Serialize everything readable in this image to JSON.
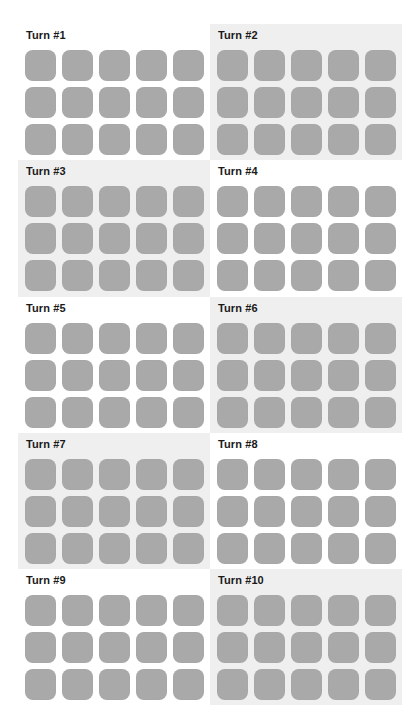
{
  "colors": {
    "tile": "#a9a9a9",
    "panel_shaded": "#efefef",
    "background": "#ffffff",
    "label": "#1a1a1a"
  },
  "grid": {
    "columns": 2,
    "tile_rows": 3,
    "tile_cols": 5
  },
  "turns": [
    {
      "label": "Turn #1",
      "shaded": false
    },
    {
      "label": "Turn #2",
      "shaded": true
    },
    {
      "label": "Turn #3",
      "shaded": true
    },
    {
      "label": "Turn #4",
      "shaded": false
    },
    {
      "label": "Turn #5",
      "shaded": false
    },
    {
      "label": "Turn #6",
      "shaded": true
    },
    {
      "label": "Turn #7",
      "shaded": true
    },
    {
      "label": "Turn #8",
      "shaded": false
    },
    {
      "label": "Turn #9",
      "shaded": false
    },
    {
      "label": "Turn #10",
      "shaded": true
    }
  ]
}
